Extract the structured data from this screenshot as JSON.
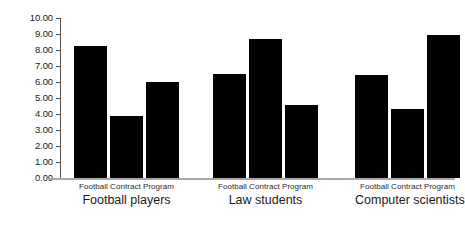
{
  "chart_data": {
    "type": "bar",
    "title": "",
    "subtitle": "",
    "xlabel": "",
    "ylabel": "",
    "ylim": [
      0,
      10
    ],
    "ytick_labels": [
      "10.00",
      "9.00",
      "8.00",
      "7.00",
      "6.00",
      "5.00",
      "4.00",
      "3.00",
      "2.00",
      "1.00",
      "0.00"
    ],
    "ytick_values": [
      10,
      9,
      8,
      7,
      6,
      5,
      4,
      3,
      2,
      1,
      0
    ],
    "grid": false,
    "legend_position": "none",
    "bar_color": "#000000",
    "axis_color": "#4d4d4d",
    "categories": [
      "Football players",
      "Law students",
      "Computer scientists"
    ],
    "series": [
      {
        "name": "Football",
        "values": [
          8.25,
          6.5,
          6.45
        ]
      },
      {
        "name": "Contract",
        "values": [
          3.85,
          8.7,
          4.3
        ]
      },
      {
        "name": "Program",
        "values": [
          6.0,
          4.55,
          8.95
        ]
      }
    ],
    "groups": [
      {
        "name": "Football players",
        "series_labels_line": "Football Contract Program",
        "bars": [
          {
            "label": "Football",
            "value": 8.25
          },
          {
            "label": "Contract",
            "value": 3.85
          },
          {
            "label": "Program",
            "value": 6.0
          }
        ]
      },
      {
        "name": "Law students",
        "series_labels_line": "Football Contract Program",
        "bars": [
          {
            "label": "Football",
            "value": 6.5
          },
          {
            "label": "Contract",
            "value": 8.7
          },
          {
            "label": "Program",
            "value": 4.55
          }
        ]
      },
      {
        "name": "Computer scientists",
        "series_labels_line": "Football Contract Program",
        "bars": [
          {
            "label": "Football",
            "value": 6.45
          },
          {
            "label": "Contract",
            "value": 4.3
          },
          {
            "label": "Program",
            "value": 8.95
          }
        ]
      }
    ]
  }
}
